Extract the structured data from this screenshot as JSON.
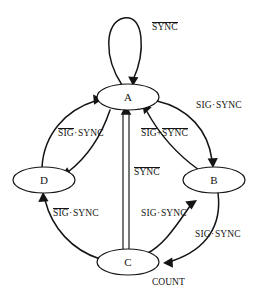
{
  "diagram": {
    "type": "state-transition-diagram",
    "title": "",
    "background_color": "#ffffff",
    "line_color": "#141414",
    "width": 263,
    "height": 298
  },
  "states": [
    {
      "id": "A",
      "label": "A",
      "cx": 128,
      "cy": 97,
      "rx": 31,
      "ry": 13
    },
    {
      "id": "B",
      "label": "B",
      "cx": 214,
      "cy": 180,
      "rx": 31,
      "ry": 13
    },
    {
      "id": "C",
      "label": "C",
      "cx": 128,
      "cy": 262,
      "rx": 31,
      "ry": 13
    },
    {
      "id": "D",
      "label": "D",
      "cx": 44,
      "cy": 180,
      "rx": 31,
      "ry": 13
    }
  ],
  "annotations": [
    {
      "name": "count-note",
      "text": "COUNT",
      "x": 152,
      "y": 277
    }
  ],
  "edges": [
    {
      "name": "edge-a-self-loop",
      "from": "A",
      "to": "A",
      "label_parts": [
        {
          "text": "SYNC",
          "overline": true
        }
      ],
      "label_x": 152,
      "label_y": 28
    },
    {
      "name": "edge-a-to-b",
      "from": "A",
      "to": "B",
      "label_parts": [
        {
          "text": "SIG",
          "overline": false
        },
        {
          "text": "·",
          "overline": false
        },
        {
          "text": "SYNC",
          "overline": false
        }
      ],
      "label_x": 196,
      "label_y": 105
    },
    {
      "name": "edge-b-to-a",
      "from": "B",
      "to": "A",
      "label_parts": [
        {
          "text": "SIG",
          "overline": true
        },
        {
          "text": "+",
          "overline": false
        },
        {
          "text": "SYNC",
          "overline": true
        }
      ],
      "label_x": 141,
      "label_y": 133
    },
    {
      "name": "edge-d-to-a",
      "from": "D",
      "to": "A",
      "label_parts": [
        {
          "text": "SIG",
          "overline": true
        },
        {
          "text": "·",
          "overline": false
        },
        {
          "text": "SYNC",
          "overline": false
        }
      ],
      "label_x": 58,
      "label_y": 133
    },
    {
      "name": "edge-a-to-d",
      "from": "A",
      "to": "D",
      "label_parts": [],
      "label_x": 0,
      "label_y": 0
    },
    {
      "name": "edge-c-to-a",
      "from": "C",
      "to": "A",
      "label_parts": [
        {
          "text": "SYNC",
          "overline": true
        }
      ],
      "label_x": 134,
      "label_y": 172
    },
    {
      "name": "edge-c-to-d",
      "from": "C",
      "to": "D",
      "label_parts": [
        {
          "text": "SIG",
          "overline": true
        },
        {
          "text": "·",
          "overline": false
        },
        {
          "text": "SYNC",
          "overline": false
        }
      ],
      "label_x": 53,
      "label_y": 213
    },
    {
      "name": "edge-c-to-b",
      "from": "C",
      "to": "B",
      "label_parts": [
        {
          "text": "SIG",
          "overline": false
        },
        {
          "text": "·",
          "overline": false
        },
        {
          "text": "SYNC",
          "overline": false
        }
      ],
      "label_x": 141,
      "label_y": 213
    },
    {
      "name": "edge-b-to-c",
      "from": "B",
      "to": "C",
      "label_parts": [
        {
          "text": "SIG",
          "overline": false
        },
        {
          "text": "·",
          "overline": false
        },
        {
          "text": "SYNC",
          "overline": false
        }
      ],
      "label_x": 195,
      "label_y": 234
    }
  ]
}
